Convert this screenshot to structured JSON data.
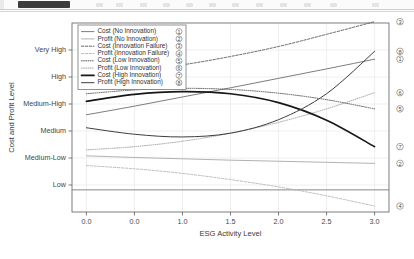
{
  "toolbar": {
    "present": true,
    "note": "cropped application toolbar strip"
  },
  "chart_data": {
    "type": "line",
    "title": "",
    "xlabel": "ESG Activity Level",
    "ylabel": "Cost and Profit Level",
    "xlim": [
      -0.15,
      3.15
    ],
    "xticks": [
      0.0,
      0.5,
      1.0,
      1.5,
      2.0,
      2.5,
      3.0
    ],
    "xticklabels": [
      "0.0",
      "0.0",
      "1.0",
      "1.5",
      "2.0",
      "2.5",
      "3.0"
    ],
    "ylim": [
      0,
      7
    ],
    "yticks": [
      1,
      2,
      3,
      4,
      5,
      6
    ],
    "yticklabels": [
      "Low",
      "Medium-Low",
      "Medium",
      "Medium-High",
      "High",
      "Very High"
    ],
    "grid": true,
    "legend_position": "upper left",
    "x": [
      0.0,
      0.5,
      1.0,
      1.5,
      2.0,
      2.5,
      3.0
    ],
    "series": [
      {
        "id": 1,
        "name": "Cost (No Innovation)",
        "marker": "①",
        "style": "solid",
        "width": 0.9,
        "color": "#6e6e6e",
        "values": [
          3.6,
          3.92,
          4.26,
          4.6,
          4.95,
          5.3,
          5.66
        ]
      },
      {
        "id": 2,
        "name": "Profit (No Innovation)",
        "marker": "②",
        "style": "solid",
        "width": 0.9,
        "color": "#a8a8a8",
        "values": [
          2.08,
          2.02,
          1.97,
          1.92,
          1.88,
          1.84,
          1.8
        ]
      },
      {
        "id": 3,
        "name": "Cost (Innovation Failure)",
        "marker": "③",
        "style": "dashed",
        "width": 0.9,
        "color": "#555555",
        "values": [
          5.05,
          5.22,
          5.45,
          5.76,
          6.13,
          6.58,
          7.05
        ]
      },
      {
        "id": 4,
        "name": "Profit (Innovation Failure)",
        "marker": "④",
        "style": "dashed",
        "width": 0.9,
        "color": "#b4b4b4",
        "values": [
          1.72,
          1.6,
          1.43,
          1.2,
          0.93,
          0.6,
          0.22
        ]
      },
      {
        "id": 5,
        "name": "Cost (Low Innovation)",
        "marker": "⑤",
        "style": "dotted",
        "width": 0.9,
        "color": "#4a4a4a",
        "values": [
          4.38,
          4.52,
          4.58,
          4.54,
          4.4,
          4.16,
          3.82
        ]
      },
      {
        "id": 6,
        "name": "Profit (Low Innovation)",
        "marker": "⑥",
        "style": "dotted",
        "width": 0.9,
        "color": "#9b9b9b",
        "values": [
          2.3,
          2.42,
          2.62,
          2.92,
          3.32,
          3.82,
          4.42
        ]
      },
      {
        "id": 7,
        "name": "Cost (High Innovation)",
        "marker": "⑦",
        "style": "solid",
        "width": 1.7,
        "color": "#171717",
        "values": [
          4.1,
          4.36,
          4.46,
          4.38,
          4.05,
          3.4,
          2.42
        ]
      },
      {
        "id": 8,
        "name": "Profit (High Innovation)",
        "marker": "⑧",
        "style": "solid",
        "width": 1.0,
        "color": "#3d3d3d",
        "values": [
          3.12,
          2.88,
          2.78,
          2.92,
          3.42,
          4.38,
          5.95
        ]
      }
    ],
    "baseline": {
      "name": "zero-reference-line",
      "value": 0.82,
      "style": "solid",
      "color": "#7a7a7a"
    },
    "legend_entries": [
      {
        "label": "Cost (No Innovation)",
        "marker": "①"
      },
      {
        "label": "Profit (No Innovation)",
        "marker": "②"
      },
      {
        "label": "Cost (Innovation Failure)",
        "marker": "③"
      },
      {
        "label": "Profit (Innovation Failure)",
        "marker": "④"
      },
      {
        "label": "Cost (Low Innovation)",
        "marker": "⑤"
      },
      {
        "label": "Profit (Low Innovation)",
        "marker": "⑥"
      },
      {
        "label": "Cost (High Innovation)",
        "marker": "⑦"
      },
      {
        "label": "Profit (High Innovation)",
        "marker": "⑧"
      }
    ],
    "end_markers_top_to_bottom": [
      "③",
      "⑧",
      "①",
      "⑥",
      "⑤",
      "②",
      "⑦",
      "④"
    ]
  }
}
